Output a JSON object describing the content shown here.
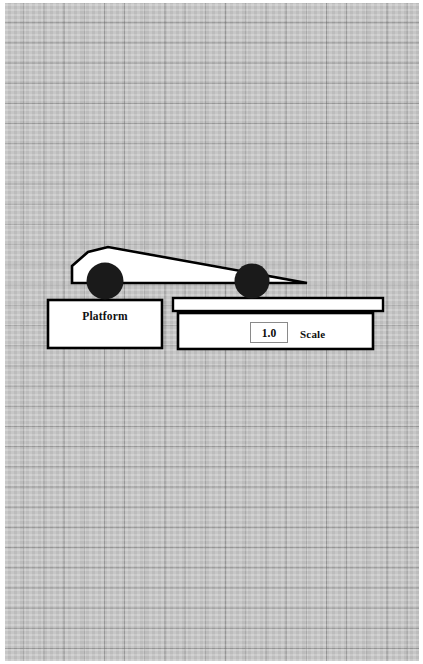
{
  "scene": {
    "title": "Car on platform and scale diagram",
    "background": {
      "type": "graph-paper",
      "cell_size_px": 20,
      "paper_color": "#c9c9c9",
      "grid_line_color": "#787878"
    },
    "colors": {
      "outline": "#000000",
      "body_fill": "#ffffff",
      "wheel_fill": "#1a1a1a",
      "box_fill": "#ffffff",
      "readout_border": "#8a8a8a"
    }
  },
  "car": {
    "name": "wedge-car",
    "body_fill": "#ffffff",
    "body_outline": "#000000",
    "body_points": "72,266 88,252 108,247 307,283 270,283 72,283",
    "front_wheel": {
      "cx": 105,
      "cy": 281,
      "r": 18.5
    },
    "rear_wheel": {
      "cx": 252,
      "cy": 281,
      "r": 17.5
    }
  },
  "platform": {
    "label": "Platform",
    "x": 48,
    "y": 300,
    "w": 114,
    "h": 48
  },
  "scale": {
    "label": "Scale",
    "plate": {
      "x": 173,
      "y": 298,
      "w": 210,
      "h": 13
    },
    "body": {
      "x": 178,
      "y": 313,
      "w": 195,
      "h": 36
    },
    "readout": {
      "value": "1.0",
      "x": 250,
      "y": 322,
      "w": 38,
      "h": 21
    }
  }
}
